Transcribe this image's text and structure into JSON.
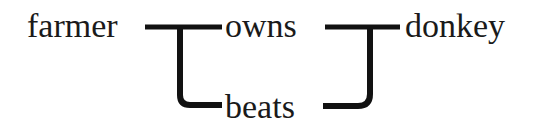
{
  "diagram": {
    "nodes": [
      {
        "id": "farmer",
        "label": "farmer"
      },
      {
        "id": "owns",
        "label": "owns"
      },
      {
        "id": "donkey",
        "label": "donkey"
      },
      {
        "id": "beats",
        "label": "beats"
      }
    ],
    "edges": [
      {
        "from": "farmer",
        "to": "owns"
      },
      {
        "from": "farmer",
        "to": "beats"
      },
      {
        "from": "owns",
        "to": "donkey"
      },
      {
        "from": "beats",
        "to": "donkey"
      }
    ],
    "colors": {
      "line": "#111111",
      "text": "#1a1a1a",
      "background": "#ffffff"
    }
  }
}
